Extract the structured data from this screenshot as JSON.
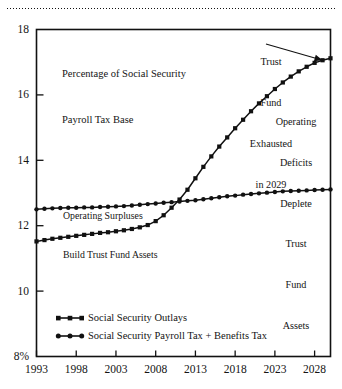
{
  "figure": {
    "name": "social-security-outlays-vs-revenues-chart",
    "top_rule": "dotted-rule"
  },
  "chart_data": {
    "type": "line",
    "title": "Percentage of Social Security\nPayroll Tax Base",
    "title_line1": "Percentage of Social Security",
    "title_line2": "Payroll Tax Base",
    "xlabel": "",
    "ylabel": "",
    "xlim": [
      1993,
      2030
    ],
    "ylim": [
      8,
      18
    ],
    "ytick_labels": [
      "18",
      "16",
      "14",
      "12",
      "10",
      "8%"
    ],
    "ytick_values": [
      18,
      16,
      14,
      12,
      10,
      8
    ],
    "xtick_labels": [
      "1993",
      "1998",
      "2003",
      "2008",
      "2013",
      "2018",
      "2023",
      "2028"
    ],
    "xtick_values": [
      1993,
      1998,
      2003,
      2008,
      2013,
      2018,
      2023,
      2028
    ],
    "grid": false,
    "legend_position": "bottom-left-inside",
    "x": [
      1993,
      1994,
      1995,
      1996,
      1997,
      1998,
      1999,
      2000,
      2001,
      2002,
      2003,
      2004,
      2005,
      2006,
      2007,
      2008,
      2009,
      2010,
      2011,
      2012,
      2013,
      2014,
      2015,
      2016,
      2017,
      2018,
      2019,
      2020,
      2021,
      2022,
      2023,
      2024,
      2025,
      2026,
      2027,
      2028,
      2029,
      2030
    ],
    "series": [
      {
        "name": "Social Security Outlays",
        "marker": "square",
        "color": "#111111",
        "values": [
          11.52,
          11.56,
          11.6,
          11.63,
          11.66,
          11.69,
          11.72,
          11.75,
          11.78,
          11.8,
          11.83,
          11.86,
          11.9,
          11.95,
          12.02,
          12.14,
          12.32,
          12.55,
          12.8,
          13.1,
          13.45,
          13.8,
          14.12,
          14.42,
          14.7,
          14.98,
          15.24,
          15.5,
          15.74,
          15.96,
          16.18,
          16.38,
          16.56,
          16.72,
          16.86,
          16.98,
          17.06,
          17.12
        ]
      },
      {
        "name": "Social Security Payroll Tax + Benefits Tax",
        "marker": "circle",
        "color": "#111111",
        "values": [
          12.5,
          12.52,
          12.53,
          12.54,
          12.55,
          12.55,
          12.56,
          12.56,
          12.57,
          12.58,
          12.59,
          12.6,
          12.62,
          12.64,
          12.66,
          12.68,
          12.7,
          12.72,
          12.74,
          12.76,
          12.78,
          12.81,
          12.84,
          12.87,
          12.9,
          12.92,
          12.95,
          12.97,
          12.99,
          13.01,
          13.03,
          13.05,
          13.06,
          13.07,
          13.08,
          13.09,
          13.1,
          13.11
        ]
      }
    ],
    "annotations": [
      {
        "name": "trust-fund-exhausted",
        "text": "Trust\nFund\nExhausted\nin 2029",
        "lines": [
          "Trust",
          "Fund",
          "Exhausted",
          "in 2029"
        ],
        "arrow": true,
        "points_to_year": 2029
      },
      {
        "name": "operating-deficits",
        "text": "Operating\nDeficits\nDeplete\nTrust\nFund\nAssets",
        "lines": [
          "Operating",
          "Deficits",
          "Deplete",
          "Trust",
          "Fund",
          "Assets"
        ],
        "arrow": false
      },
      {
        "name": "operating-surpluses",
        "text": "Operating Surpluses\nBuild Trust Fund Assets",
        "lines": [
          "Operating Surpluses",
          "Build Trust Fund Assets"
        ],
        "arrow": false
      }
    ]
  },
  "legend": {
    "items": [
      {
        "label": "Social Security Outlays"
      },
      {
        "label": "Social Security Payroll Tax + Benefits Tax"
      }
    ]
  },
  "axis": {
    "y_labels": [
      "18",
      "16",
      "14",
      "12",
      "10",
      "8%"
    ],
    "x_labels": [
      "1993",
      "1998",
      "2003",
      "2008",
      "2013",
      "2018",
      "2023",
      "2028"
    ]
  },
  "colors": {
    "ink": "#111111",
    "background": "#ffffff"
  }
}
